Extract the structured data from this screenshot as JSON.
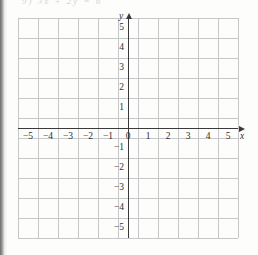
{
  "page": {
    "cutoff_text": "9) 3x + 2y = 6",
    "background_color": "#fdfdfc",
    "scan_edge_color": "#6e6e6e"
  },
  "chart_data": {
    "type": "scatter",
    "title": "",
    "subtitle": "",
    "xlabel": "x",
    "ylabel": "y",
    "xlim": [
      -5.5,
      5.5
    ],
    "ylim": [
      -5.5,
      5.5
    ],
    "grid": true,
    "legend": null,
    "series": [],
    "x_tick_labels": [
      "−5",
      "−4",
      "−3",
      "−2",
      "−1",
      "0",
      "1",
      "2",
      "3",
      "4",
      "5"
    ],
    "x_tick_values": [
      -5,
      -4,
      -3,
      -2,
      -1,
      0,
      1,
      2,
      3,
      4,
      5
    ],
    "y_tick_labels": [
      "5",
      "4",
      "3",
      "2",
      "1",
      "−1",
      "−2",
      "−3",
      "−4",
      "−5"
    ],
    "y_tick_values": [
      5,
      4,
      3,
      2,
      1,
      -1,
      -2,
      -3,
      -4,
      -5
    ],
    "origin_label": "0",
    "grid_columns": 11,
    "grid_rows": 11,
    "grid_color": "#c6c7c9",
    "axis_color": "#3a3a3c",
    "x_axis_arrow": "arrow-right-icon",
    "y_axis_arrow": "arrow-up-icon"
  }
}
